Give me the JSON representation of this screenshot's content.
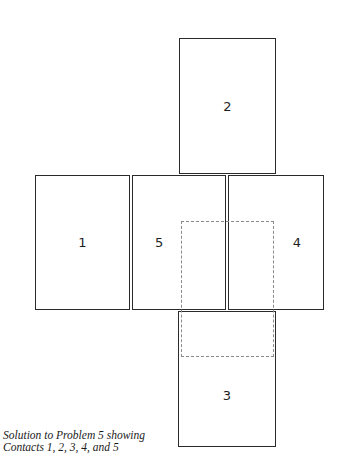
{
  "diagram": {
    "boxes": [
      {
        "id": "1",
        "label": "1"
      },
      {
        "id": "2",
        "label": "2"
      },
      {
        "id": "3",
        "label": "3"
      },
      {
        "id": "4",
        "label": "4"
      },
      {
        "id": "5",
        "label": "5"
      }
    ],
    "overlay": {
      "style": "dashed",
      "description": "dashed rectangle overlapping contacts 5, 4 and 3"
    }
  },
  "caption": {
    "line1": "Solution to Problem 5 showing",
    "line2": "Contacts 1, 2, 3, 4, and 5"
  }
}
